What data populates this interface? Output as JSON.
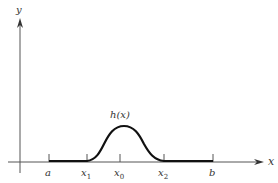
{
  "diagram": {
    "type": "function-graph",
    "axes": {
      "x_label": "x",
      "y_label": "y"
    },
    "curve_label": "h(x)",
    "ticks": [
      {
        "id": "a",
        "label": "a",
        "sub": ""
      },
      {
        "id": "x1",
        "label": "x",
        "sub": "1"
      },
      {
        "id": "x0",
        "label": "x",
        "sub": "0"
      },
      {
        "id": "x2",
        "label": "x",
        "sub": "2"
      },
      {
        "id": "b",
        "label": "b",
        "sub": ""
      }
    ]
  }
}
